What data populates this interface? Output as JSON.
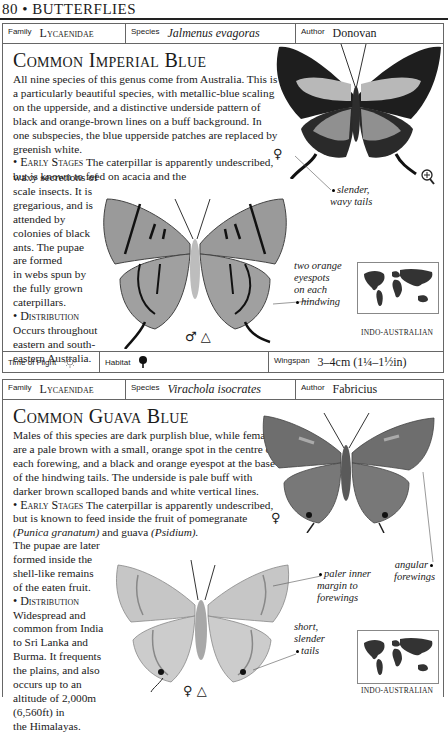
{
  "page_header": {
    "page_number": "80",
    "separator": "•",
    "section": "BUTTERFLIES"
  },
  "entries": [
    {
      "family_label": "Family",
      "family": "Lycaenidae",
      "species_label": "Species",
      "species": "Jalmenus evagoras",
      "author_label": "Author",
      "author": "Donovan",
      "title": "Common Imperial Blue",
      "intro": "All nine species of this genus come from Australia. This is a particularly beautiful species, with metallic-blue scaling on the upperside, and a distinctive underside pattern of black and orange-brown lines on a buff background. In one subspecies, the blue upperside patches are replaced by greenish white.",
      "early_stages_heading": "• Early Stages",
      "early_stages_a": "The caterpillar is apparently undescribed, but is known to feed on acacia and the",
      "early_stages_lines": [
        "waxy secretions of",
        "scale insects. It is",
        "gregarious, and is",
        "attended by",
        "colonies of black",
        "ants. The pupae",
        "are formed",
        "in webs spun by",
        "the fully grown",
        "caterpillars."
      ],
      "distribution_heading": "• Distribution",
      "distribution_lines": [
        "Occurs throughout",
        "eastern and south-",
        "eastern Australia."
      ],
      "annotations": [
        {
          "text": [
            "slender,",
            "wavy tails"
          ]
        },
        {
          "text": [
            "two orange",
            "eyespots",
            "on each",
            "hindwing"
          ]
        }
      ],
      "symbols": {
        "female": "♀",
        "male_triangle": "♂ △",
        "magnifier": "magnifier"
      },
      "map_label": "INDO-AUSTRALIAN",
      "footer": {
        "time_of_flight_label": "Time of Flight",
        "time_of_flight_icon": "sun-icon",
        "habitat_label": "Habitat",
        "habitat_icon": "tree-icon",
        "wingspan_label": "Wingspan",
        "wingspan": "3–4cm (1¼–1½in)"
      }
    },
    {
      "family_label": "Family",
      "family": "Lycaenidae",
      "species_label": "Species",
      "species": "Virachola isocrates",
      "author_label": "Author",
      "author": "Fabricius",
      "title": "Common Guava Blue",
      "intro": "Males of this species are dark purplish blue, while females are a pale brown with a small, orange spot in the centre of each forewing, and a black and orange eyespot at the base of the hindwing tails. The underside is pale buff with darker brown scalloped bands and white vertical lines.",
      "early_stages_heading": "• Early Stages",
      "early_stages_a": "The caterpillar is apparently undescribed, but is known to feed inside the fruit of pomegranate",
      "early_stages_b1": "(Punica granatum)",
      "early_stages_b2": " and guava ",
      "early_stages_b3": "(Psidium).",
      "early_stages_lines": [
        "The pupae are later",
        "formed inside the",
        "shell-like remains",
        "of the eaten fruit."
      ],
      "distribution_heading": "• Distribution",
      "distribution_lines": [
        "Widespread and",
        "common from India",
        "to Sri Lanka and",
        "Burma. It frequents",
        "the plains, and also",
        "occurs up to an",
        "altitude of 2,000m",
        "(6,560ft) in",
        "the Himalayas."
      ],
      "annotations": [
        {
          "text": [
            "angular",
            "forewings"
          ]
        },
        {
          "text": [
            "paler inner",
            "margin to",
            "forewings"
          ]
        },
        {
          "text": [
            "short,",
            "slender",
            "tails"
          ]
        }
      ],
      "symbols": {
        "female_top": "♀",
        "female_triangle": "♀ △"
      },
      "map_label": "INDO-AUSTRALIAN"
    }
  ],
  "colors": {
    "border": "#666666",
    "text": "#1a1a1a",
    "butterfly_dark": "#222222",
    "butterfly_grey": "#8a8a8a",
    "butterfly_light": "#c9c9c9"
  }
}
